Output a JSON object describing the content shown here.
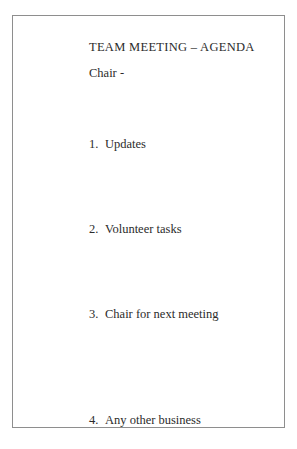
{
  "document": {
    "title": "TEAM MEETING – AGENDA",
    "chair_label": "Chair -",
    "agenda_items": [
      {
        "number": "1.",
        "label": "Updates"
      },
      {
        "number": "2.",
        "label": "Volunteer tasks"
      },
      {
        "number": "3.",
        "label": "Chair for next meeting"
      },
      {
        "number": "4.",
        "label": "Any other business"
      }
    ]
  },
  "colors": {
    "page_background": "#ffffff",
    "border": "#8e8e8e",
    "text": "#2b2b2b"
  }
}
